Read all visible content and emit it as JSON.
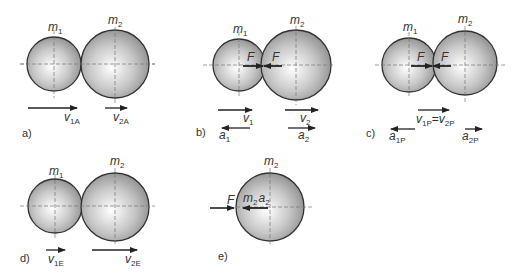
{
  "figure": {
    "panels": [
      {
        "id": "a",
        "label": "a)",
        "mass1": {
          "name": "m",
          "sub": "1"
        },
        "mass2": {
          "name": "m",
          "sub": "2"
        },
        "vectors": [
          {
            "name": "v",
            "sub": "1A",
            "direction": "right"
          },
          {
            "name": "v",
            "sub": "2A",
            "direction": "right"
          }
        ]
      },
      {
        "id": "b",
        "label": "b)",
        "mass1": {
          "name": "m",
          "sub": "1"
        },
        "mass2": {
          "name": "m",
          "sub": "2"
        },
        "forces": [
          {
            "name": "F"
          },
          {
            "name": "F"
          }
        ],
        "vectors": [
          {
            "name": "v",
            "sub": "1",
            "direction": "right"
          },
          {
            "name": "v",
            "sub": "2",
            "direction": "right"
          },
          {
            "name": "a",
            "sub": "1",
            "direction": "left"
          },
          {
            "name": "a",
            "sub": "2",
            "direction": "right"
          }
        ]
      },
      {
        "id": "c",
        "label": "c)",
        "mass1": {
          "name": "m",
          "sub": "1"
        },
        "mass2": {
          "name": "m",
          "sub": "2"
        },
        "forces": [
          {
            "name": "F"
          },
          {
            "name": "F"
          }
        ],
        "vectors": [
          {
            "name": "v",
            "sub": "1P",
            "eq": "=",
            "name2": "v",
            "sub2": "2P",
            "direction": "right"
          },
          {
            "name": "a",
            "sub": "1P",
            "direction": "left"
          },
          {
            "name": "a",
            "sub": "2P",
            "direction": "right"
          }
        ]
      },
      {
        "id": "d",
        "label": "d)",
        "mass1": {
          "name": "m",
          "sub": "1"
        },
        "mass2": {
          "name": "m",
          "sub": "2"
        },
        "vectors": [
          {
            "name": "v",
            "sub": "1E",
            "direction": "right"
          },
          {
            "name": "v",
            "sub": "2E",
            "direction": "right"
          }
        ]
      },
      {
        "id": "e",
        "label": "e)",
        "mass2": {
          "name": "m",
          "sub": "2"
        },
        "forces": [
          {
            "name": "F"
          }
        ],
        "inertial": {
          "name": "m",
          "sub": "2",
          "name2": "a",
          "sub2": "2"
        }
      }
    ],
    "colors": {
      "sphere_edge": "#333333",
      "sphere_light": "#ffffff",
      "sphere_dark": "#8a8a8a",
      "ink": "#222222",
      "axis": "#666666"
    }
  }
}
